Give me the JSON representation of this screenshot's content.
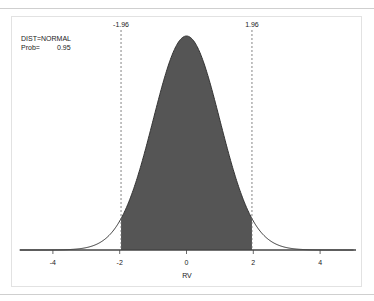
{
  "chart_data": {
    "type": "area",
    "title": "",
    "distribution": "NORMAL",
    "probability": 0.95,
    "annotations": {
      "dist_label": "DIST=NORMAL",
      "prob_label": "Prob=",
      "prob_value": "0.95",
      "lower_critical": "-1.96",
      "upper_critical": "1.96"
    },
    "critical_values": [
      -1.96,
      1.96
    ],
    "shaded_region": [
      -1.96,
      1.96
    ],
    "xlabel": "RV",
    "ylabel": "",
    "xlim": [
      -5,
      5
    ],
    "xticks": [
      -4,
      -2,
      0,
      2,
      4
    ],
    "xtick_labels": [
      "-4",
      "-2",
      "0",
      "2",
      "4"
    ],
    "grid": false,
    "legend": "none",
    "colors": {
      "fill": "#555555",
      "curve": "#333333",
      "dashed": "#777777"
    }
  }
}
